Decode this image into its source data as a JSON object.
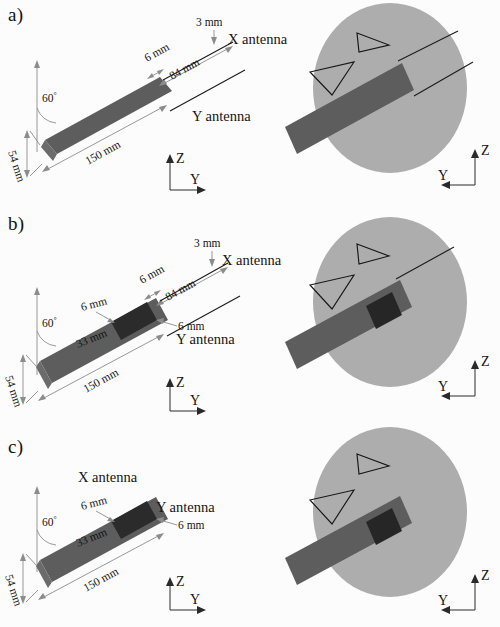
{
  "figure": {
    "colors": {
      "slab": "#5d5d5d",
      "inset": "#2b2b2b",
      "phantom": "#adadad",
      "line": "#1d1d1d",
      "background": "#fcfcfc"
    }
  },
  "panels": [
    {
      "id": "a",
      "label": "a)",
      "left_view": {
        "angle": "60",
        "degree_symbol": "°",
        "dimensions": [
          {
            "name": "thickness",
            "text": "3 mm"
          },
          {
            "name": "gap",
            "text": "6 mm"
          },
          {
            "name": "antenna-length",
            "text": "84 mm"
          },
          {
            "name": "slab-length",
            "text": "150 mm"
          },
          {
            "name": "slab-width",
            "text": "54 mm"
          }
        ],
        "antennas": [
          {
            "name": "x-antenna",
            "text": "X antenna"
          },
          {
            "name": "y-antenna",
            "text": "Y antenna"
          }
        ],
        "axes": {
          "vertical": "Z",
          "horizontal": "Y"
        }
      },
      "right_view": {
        "axes": {
          "vertical": "Z",
          "horizontal": "Y"
        },
        "has_phantom": true,
        "antenna_lines": 2,
        "has_inset": false
      }
    },
    {
      "id": "b",
      "label": "b)",
      "left_view": {
        "angle": "60",
        "degree_symbol": "°",
        "dimensions": [
          {
            "name": "thickness",
            "text": "3 mm"
          },
          {
            "name": "gap",
            "text": "6 mm"
          },
          {
            "name": "antenna-length",
            "text": "84 mm"
          },
          {
            "name": "inset-left-offset",
            "text": "6 mm"
          },
          {
            "name": "inset-right-offset",
            "text": "6 mm"
          },
          {
            "name": "inset-size",
            "text": "33 mm"
          },
          {
            "name": "slab-length",
            "text": "150 mm"
          },
          {
            "name": "slab-width",
            "text": "54 mm"
          }
        ],
        "antennas": [
          {
            "name": "x-antenna",
            "text": "X antenna"
          },
          {
            "name": "y-antenna",
            "text": "Y antenna"
          }
        ],
        "axes": {
          "vertical": "Z",
          "horizontal": "Y"
        }
      },
      "right_view": {
        "axes": {
          "vertical": "Z",
          "horizontal": "Y"
        },
        "has_phantom": true,
        "antenna_lines": 1,
        "has_inset": true
      }
    },
    {
      "id": "c",
      "label": "c)",
      "left_view": {
        "angle": "60",
        "degree_symbol": "°",
        "dimensions": [
          {
            "name": "inset-left-offset",
            "text": "6 mm"
          },
          {
            "name": "inset-right-offset",
            "text": "6 mm"
          },
          {
            "name": "inset-size",
            "text": "33 mm"
          },
          {
            "name": "slab-length",
            "text": "150 mm"
          },
          {
            "name": "slab-width",
            "text": "54 mm"
          }
        ],
        "antennas": [
          {
            "name": "x-antenna",
            "text": "X antenna"
          },
          {
            "name": "y-antenna",
            "text": "Y antenna"
          }
        ],
        "axes": {
          "vertical": "Z",
          "horizontal": "Y"
        }
      },
      "right_view": {
        "axes": {
          "vertical": "Z",
          "horizontal": "Y"
        },
        "has_phantom": true,
        "antenna_lines": 0,
        "has_inset": true
      }
    }
  ]
}
